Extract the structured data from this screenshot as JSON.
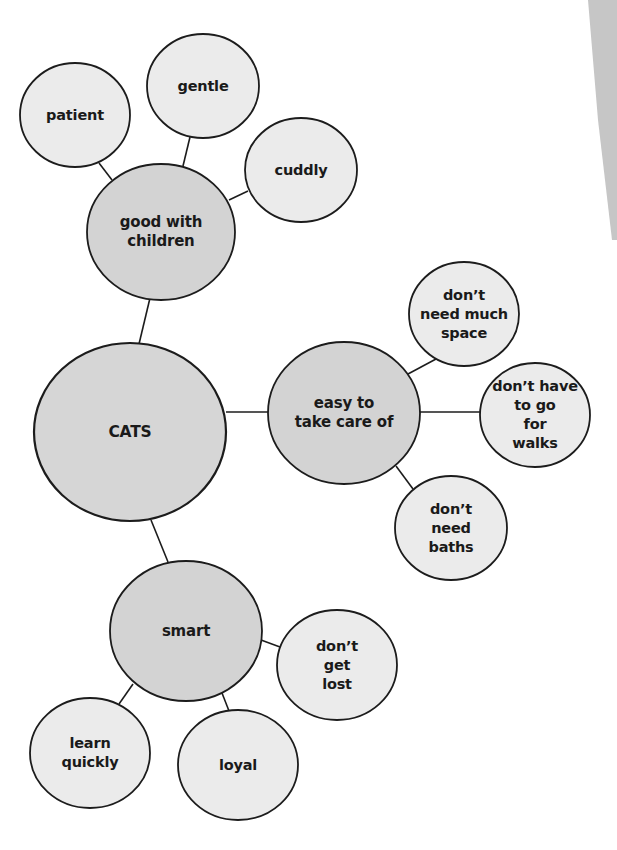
{
  "diagram": {
    "type": "bubble-map",
    "colors": {
      "background": "#ffffff",
      "center_fill": "#d6d6d6",
      "main_fill": "#d3d3d3",
      "leaf_fill": "#ebebeb",
      "stroke": "#1c1c1c",
      "page_shadow": "#c6c6c6"
    },
    "center": {
      "id": "cats",
      "label": "CATS",
      "cx": 130,
      "cy": 432,
      "rx": 96,
      "ry": 89
    },
    "branches": [
      {
        "id": "good-with-children",
        "label": "good with\nchildren",
        "cx": 161,
        "cy": 232,
        "rx": 74,
        "ry": 68,
        "leaves": [
          {
            "id": "patient",
            "label": "patient",
            "cx": 75,
            "cy": 115,
            "rx": 55,
            "ry": 52
          },
          {
            "id": "gentle",
            "label": "gentle",
            "cx": 203,
            "cy": 86,
            "rx": 56,
            "ry": 52
          },
          {
            "id": "cuddly",
            "label": "cuddly",
            "cx": 301,
            "cy": 170,
            "rx": 56,
            "ry": 52
          }
        ]
      },
      {
        "id": "easy-to-take-care-of",
        "label": "easy to\ntake care of",
        "cx": 344,
        "cy": 413,
        "rx": 76,
        "ry": 71,
        "leaves": [
          {
            "id": "dont-need-much-space",
            "label": "don’t\nneed much\nspace",
            "cx": 464,
            "cy": 314,
            "rx": 55,
            "ry": 52
          },
          {
            "id": "dont-have-to-go-for-walks",
            "label": "don’t have\nto go\nfor\nwalks",
            "cx": 535,
            "cy": 415,
            "rx": 55,
            "ry": 52
          },
          {
            "id": "dont-need-baths",
            "label": "don’t\nneed\nbaths",
            "cx": 451,
            "cy": 528,
            "rx": 56,
            "ry": 52
          }
        ]
      },
      {
        "id": "smart",
        "label": "smart",
        "cx": 186,
        "cy": 631,
        "rx": 76,
        "ry": 70,
        "leaves": [
          {
            "id": "dont-get-lost",
            "label": "don’t\nget\nlost",
            "cx": 337,
            "cy": 665,
            "rx": 60,
            "ry": 55
          },
          {
            "id": "learn-quickly",
            "label": "learn\nquickly",
            "cx": 90,
            "cy": 753,
            "rx": 60,
            "ry": 55
          },
          {
            "id": "loyal",
            "label": "loyal",
            "cx": 238,
            "cy": 765,
            "rx": 60,
            "ry": 55
          }
        ]
      }
    ],
    "connectors": [
      {
        "from": "patient",
        "to": "good-with-children",
        "x1": 99,
        "y1": 163,
        "x2": 112,
        "y2": 180
      },
      {
        "from": "gentle",
        "to": "good-with-children",
        "x1": 190,
        "y1": 137,
        "x2": 183,
        "y2": 166
      },
      {
        "from": "cuddly",
        "to": "good-with-children",
        "x1": 248,
        "y1": 191,
        "x2": 229,
        "y2": 200
      },
      {
        "from": "good-with-children",
        "to": "cats",
        "x1": 150,
        "y1": 298,
        "x2": 139,
        "y2": 344
      },
      {
        "from": "cats",
        "to": "easy-to-take-care-of",
        "x1": 226,
        "y1": 412,
        "x2": 268,
        "y2": 412
      },
      {
        "from": "easy-to-take-care-of",
        "to": "dont-need-much-space",
        "x1": 408,
        "y1": 374,
        "x2": 436,
        "y2": 359
      },
      {
        "from": "easy-to-take-care-of",
        "to": "dont-have-to-go-for-walks",
        "x1": 420,
        "y1": 412,
        "x2": 480,
        "y2": 412
      },
      {
        "from": "easy-to-take-care-of",
        "to": "dont-need-baths",
        "x1": 396,
        "y1": 466,
        "x2": 413,
        "y2": 489
      },
      {
        "from": "cats",
        "to": "smart",
        "x1": 151,
        "y1": 520,
        "x2": 168,
        "y2": 562
      },
      {
        "from": "smart",
        "to": "dont-get-lost",
        "x1": 261,
        "y1": 640,
        "x2": 280,
        "y2": 647
      },
      {
        "from": "smart",
        "to": "learn-quickly",
        "x1": 133,
        "y1": 684,
        "x2": 119,
        "y2": 704
      },
      {
        "from": "smart",
        "to": "loyal",
        "x1": 222,
        "y1": 693,
        "x2": 229,
        "y2": 711
      }
    ]
  }
}
